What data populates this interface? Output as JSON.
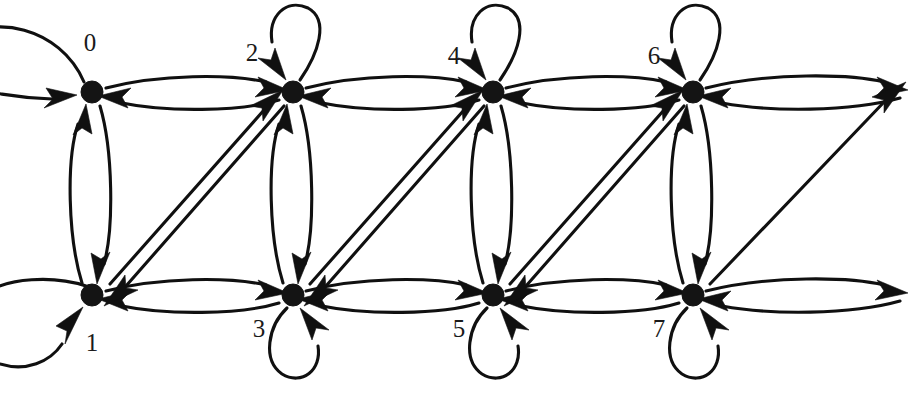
{
  "diagram": {
    "type": "directed-graph",
    "width": 923,
    "height": 400,
    "background_color": "#ffffff",
    "stroke_color": "#101010",
    "label_color": "#1a1a1a",
    "node_radius": 11,
    "node_count": 8,
    "edge_style": "curved-with-arrowheads",
    "nodes": [
      {
        "id": "0",
        "label": "0",
        "x": 92,
        "y": 92,
        "row": "top",
        "column": 0,
        "label_x": 90,
        "label_y": 45
      },
      {
        "id": "1",
        "label": "1",
        "x": 92,
        "y": 295,
        "row": "bottom",
        "column": 0,
        "label_x": 92,
        "label_y": 345
      },
      {
        "id": "2",
        "label": "2",
        "x": 293,
        "y": 92,
        "row": "top",
        "column": 1,
        "label_x": 252,
        "label_y": 55
      },
      {
        "id": "3",
        "label": "3",
        "x": 293,
        "y": 295,
        "row": "bottom",
        "column": 1,
        "label_x": 259,
        "label_y": 331
      },
      {
        "id": "4",
        "label": "4",
        "x": 493,
        "y": 92,
        "row": "top",
        "column": 2,
        "label_x": 454,
        "label_y": 58
      },
      {
        "id": "5",
        "label": "5",
        "x": 493,
        "y": 295,
        "row": "bottom",
        "column": 2,
        "label_x": 459,
        "label_y": 331
      },
      {
        "id": "6",
        "label": "6",
        "x": 693,
        "y": 92,
        "row": "top",
        "column": 3,
        "label_x": 654,
        "label_y": 58
      },
      {
        "id": "7",
        "label": "7",
        "x": 693,
        "y": 295,
        "row": "bottom",
        "column": 3,
        "label_x": 659,
        "label_y": 331
      }
    ],
    "self_loops": [
      {
        "node": "0",
        "label": "0",
        "orientation": "left-wrap"
      },
      {
        "node": "1",
        "label": "1",
        "orientation": "left-wrap"
      },
      {
        "node": "2",
        "label": "2",
        "orientation": "above"
      },
      {
        "node": "3",
        "label": "3",
        "orientation": "below"
      },
      {
        "node": "4",
        "label": "4",
        "orientation": "above"
      },
      {
        "node": "5",
        "label": "5",
        "orientation": "below"
      },
      {
        "node": "6",
        "label": "6",
        "orientation": "above"
      },
      {
        "node": "7",
        "label": "7",
        "orientation": "below"
      }
    ],
    "edges": [
      {
        "from": "0",
        "to": "0",
        "kind": "self-loop"
      },
      {
        "from": "0",
        "to": "2",
        "kind": "horizontal"
      },
      {
        "from": "2",
        "to": "0",
        "kind": "horizontal"
      },
      {
        "from": "0",
        "to": "1",
        "kind": "vertical"
      },
      {
        "from": "1",
        "to": "0",
        "kind": "vertical"
      },
      {
        "from": "1",
        "to": "1",
        "kind": "self-loop"
      },
      {
        "from": "1",
        "to": "2",
        "kind": "diagonal"
      },
      {
        "from": "2",
        "to": "1",
        "kind": "diagonal"
      },
      {
        "from": "1",
        "to": "3",
        "kind": "horizontal"
      },
      {
        "from": "3",
        "to": "1",
        "kind": "horizontal"
      },
      {
        "from": "2",
        "to": "2",
        "kind": "self-loop"
      },
      {
        "from": "2",
        "to": "4",
        "kind": "horizontal"
      },
      {
        "from": "4",
        "to": "2",
        "kind": "horizontal"
      },
      {
        "from": "2",
        "to": "3",
        "kind": "vertical"
      },
      {
        "from": "3",
        "to": "2",
        "kind": "vertical"
      },
      {
        "from": "3",
        "to": "3",
        "kind": "self-loop"
      },
      {
        "from": "3",
        "to": "4",
        "kind": "diagonal"
      },
      {
        "from": "4",
        "to": "3",
        "kind": "diagonal"
      },
      {
        "from": "3",
        "to": "5",
        "kind": "horizontal"
      },
      {
        "from": "5",
        "to": "3",
        "kind": "horizontal"
      },
      {
        "from": "4",
        "to": "4",
        "kind": "self-loop"
      },
      {
        "from": "4",
        "to": "6",
        "kind": "horizontal"
      },
      {
        "from": "6",
        "to": "4",
        "kind": "horizontal"
      },
      {
        "from": "4",
        "to": "5",
        "kind": "vertical"
      },
      {
        "from": "5",
        "to": "4",
        "kind": "vertical"
      },
      {
        "from": "5",
        "to": "5",
        "kind": "self-loop"
      },
      {
        "from": "5",
        "to": "6",
        "kind": "diagonal"
      },
      {
        "from": "6",
        "to": "5",
        "kind": "diagonal"
      },
      {
        "from": "5",
        "to": "7",
        "kind": "horizontal"
      },
      {
        "from": "7",
        "to": "5",
        "kind": "horizontal"
      },
      {
        "from": "6",
        "to": "6",
        "kind": "self-loop"
      },
      {
        "from": "6",
        "to": "7",
        "kind": "vertical"
      },
      {
        "from": "7",
        "to": "6",
        "kind": "vertical"
      },
      {
        "from": "7",
        "to": "7",
        "kind": "self-loop"
      },
      {
        "from": "6",
        "to": "wrap-right-top",
        "kind": "horizontal-wrap"
      },
      {
        "from": "wrap-right-top",
        "to": "6",
        "kind": "horizontal-wrap"
      },
      {
        "from": "7",
        "to": "wrap-right-top",
        "kind": "diagonal-wrap"
      },
      {
        "from": "7",
        "to": "wrap-right-bottom",
        "kind": "horizontal-wrap"
      },
      {
        "from": "wrap-right-bottom",
        "to": "7",
        "kind": "horizontal-wrap"
      }
    ]
  }
}
